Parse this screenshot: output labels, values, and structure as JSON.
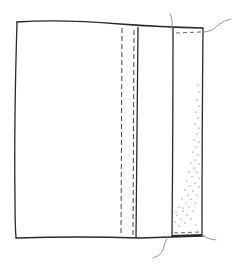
{
  "diagram": {
    "title": "Fabric panel with stitched binding strip",
    "colors": {
      "background": "#ffffff",
      "outline": "#2a2a2a",
      "stitch": "#444444",
      "thread": "#8a8a8a",
      "stipple": "#555555"
    },
    "parts": [
      {
        "id": "panel",
        "label": "fabric panel"
      },
      {
        "id": "stitch-line-left",
        "label": "stitch line"
      },
      {
        "id": "stitch-line-right",
        "label": "stitch line"
      },
      {
        "id": "fold-line",
        "label": "fold line"
      },
      {
        "id": "binding-strip",
        "label": "binding strip"
      },
      {
        "id": "thread-tails",
        "label": "thread tails"
      }
    ]
  }
}
